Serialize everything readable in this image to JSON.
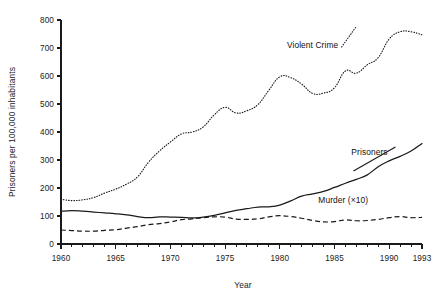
{
  "chart_data": {
    "type": "line",
    "title": "",
    "xlabel": "Year",
    "ylabel": "Prisoners per 100,000 inhabitants",
    "xlim": [
      1960,
      1993
    ],
    "ylim": [
      0,
      800
    ],
    "grid": false,
    "legend_position": "inline-annotations",
    "y_ticks": [
      0,
      100,
      200,
      300,
      400,
      500,
      600,
      700,
      800
    ],
    "y_tick_labels": [
      "0",
      "100",
      "200",
      "300",
      "400",
      "500",
      "600",
      "700",
      "800"
    ],
    "x_ticks": [
      1960,
      1965,
      1970,
      1975,
      1980,
      1985,
      1990,
      1993
    ],
    "x_tick_labels": [
      "1960",
      "1965",
      "1970",
      "1975",
      "1980",
      "1985",
      "1990",
      "1993"
    ],
    "x_minor_tick_step": 1,
    "x": [
      1960,
      1961,
      1962,
      1963,
      1964,
      1965,
      1966,
      1967,
      1968,
      1969,
      1970,
      1971,
      1972,
      1973,
      1974,
      1975,
      1976,
      1977,
      1978,
      1979,
      1980,
      1981,
      1982,
      1983,
      1984,
      1985,
      1986,
      1987,
      1988,
      1989,
      1990,
      1991,
      1992,
      1993
    ],
    "series": [
      {
        "name": "Violent Crime",
        "style": "dotted",
        "label": "Violent Crime",
        "label_x": 1983.0,
        "label_y": 700,
        "values": [
          160,
          155,
          158,
          166,
          182,
          196,
          214,
          240,
          292,
          332,
          364,
          393,
          400,
          418,
          461,
          488,
          468,
          476,
          498,
          549,
          597,
          594,
          571,
          538,
          539,
          558,
          618,
          610,
          640,
          666,
          732,
          758,
          758,
          747
        ]
      },
      {
        "name": "Prisoners",
        "style": "solid",
        "label": "Prisoners",
        "label_x": 1988.2,
        "label_y": 318,
        "values": [
          117,
          119,
          117,
          114,
          111,
          108,
          104,
          98,
          94,
          97,
          96,
          95,
          93,
          96,
          102,
          111,
          120,
          126,
          132,
          133,
          139,
          154,
          171,
          179,
          188,
          202,
          217,
          231,
          247,
          276,
          297,
          313,
          332,
          359
        ]
      },
      {
        "name": "Murder (×10)",
        "style": "dashed",
        "label": "Murder (×10)",
        "label_x": 1985.8,
        "label_y": 148,
        "values": [
          50,
          48,
          46,
          46,
          49,
          51,
          57,
          62,
          69,
          73,
          79,
          87,
          90,
          94,
          97,
          96,
          89,
          88,
          90,
          97,
          101,
          98,
          92,
          84,
          79,
          80,
          86,
          83,
          84,
          88,
          94,
          98,
          94,
          95
        ]
      }
    ]
  },
  "labels": {
    "y_axis_title": "Prisoners per 100,000 inhabitants",
    "x_axis_title": "Year"
  }
}
